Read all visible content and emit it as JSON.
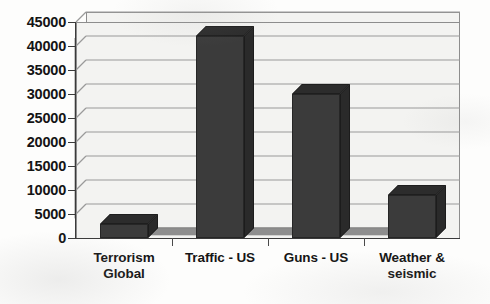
{
  "chart_data": {
    "type": "bar",
    "title": "",
    "subtitle": "",
    "xlabel": "",
    "ylabel": "",
    "categories": [
      "Terrorism Global",
      "Traffic - US",
      "Guns - US",
      "Weather & seismic"
    ],
    "category_lines": [
      [
        "Terrorism",
        "Global"
      ],
      [
        "Traffic - US"
      ],
      [
        "Guns - US"
      ],
      [
        "Weather &",
        "seismic"
      ]
    ],
    "values": [
      3000,
      42000,
      30000,
      9000
    ],
    "ylim": [
      0,
      45000
    ],
    "ytick_step": 5000,
    "ytick_labels": [
      "45000",
      "40000",
      "35000",
      "30000",
      "25000",
      "20000",
      "15000",
      "10000",
      "5000",
      "0"
    ],
    "ytick_values": [
      45000,
      40000,
      35000,
      30000,
      25000,
      20000,
      15000,
      10000,
      5000,
      0
    ],
    "grid": true,
    "grid_axis": "y",
    "legend": false,
    "legend_position": "none",
    "three_d": true,
    "series": [
      {
        "name": "Deaths per year",
        "values": [
          3000,
          42000,
          30000,
          9000
        ]
      }
    ],
    "colors": {
      "bar_front": "#3b3b3b",
      "bar_top": "#2c2c2c",
      "bar_side": "#2a2a2a",
      "plot_background": "#f3f3f1",
      "floor": "#8e8e8e",
      "gridline": "#9a9a9a",
      "axis": "#3a3a3a",
      "text": "#141414",
      "page_background": "#fdfdfc"
    }
  }
}
